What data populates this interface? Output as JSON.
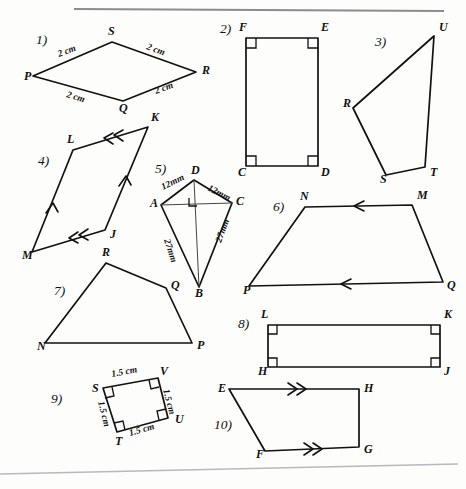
{
  "page": {
    "background_color": "#fdfdfc",
    "ink_color": "#111111",
    "scan_edge_color": "#8c8c90"
  },
  "figures": [
    {
      "number": "1)",
      "shape": "rhombus",
      "vertices": [
        {
          "label": "P",
          "x": 33,
          "y": 76,
          "lx": 24,
          "ly": 80
        },
        {
          "label": "S",
          "x": 112,
          "y": 42,
          "lx": 108,
          "ly": 35
        },
        {
          "label": "R",
          "x": 196,
          "y": 72,
          "lx": 202,
          "ly": 74
        },
        {
          "label": "Q",
          "x": 123,
          "y": 101,
          "lx": 119,
          "ly": 112
        }
      ],
      "number_pos": {
        "x": 36,
        "y": 44
      },
      "measures": [
        {
          "text": "2 cm",
          "x": 59,
          "y": 57,
          "rotate": -21
        },
        {
          "text": "2 cm",
          "x": 146,
          "y": 49,
          "rotate": 20
        },
        {
          "text": "2 cm",
          "x": 66,
          "y": 97,
          "rotate": 17
        },
        {
          "text": "2 cm",
          "x": 156,
          "y": 94,
          "rotate": -20
        }
      ]
    },
    {
      "number": "2)",
      "shape": "rectangle",
      "vertices": [
        {
          "label": "F",
          "x": 246,
          "y": 38,
          "lx": 239,
          "ly": 31
        },
        {
          "label": "E",
          "x": 318,
          "y": 38,
          "lx": 321,
          "ly": 31
        },
        {
          "label": "D",
          "x": 318,
          "y": 166,
          "lx": 321,
          "ly": 176
        },
        {
          "label": "C",
          "x": 246,
          "y": 166,
          "lx": 238,
          "ly": 176
        }
      ],
      "number_pos": {
        "x": 220,
        "y": 33
      },
      "right_angles": [
        "F",
        "E",
        "D",
        "C"
      ]
    },
    {
      "number": "3)",
      "shape": "irregular-quadrilateral",
      "vertices": [
        {
          "label": "U",
          "x": 434,
          "y": 36,
          "lx": 439,
          "ly": 31
        },
        {
          "label": "T",
          "x": 425,
          "y": 167,
          "lx": 430,
          "ly": 176
        },
        {
          "label": "S",
          "x": 386,
          "y": 175,
          "lx": 380,
          "ly": 183
        },
        {
          "label": "R",
          "x": 353,
          "y": 108,
          "lx": 343,
          "ly": 107
        }
      ],
      "number_pos": {
        "x": 375,
        "y": 46
      }
    },
    {
      "number": "4)",
      "shape": "parallelogram",
      "vertices": [
        {
          "label": "K",
          "x": 148,
          "y": 127,
          "lx": 151,
          "ly": 121
        },
        {
          "label": "L",
          "x": 73,
          "y": 150,
          "lx": 67,
          "ly": 143
        },
        {
          "label": "M",
          "x": 32,
          "y": 252,
          "lx": 22,
          "ly": 259
        },
        {
          "label": "J",
          "x": 105,
          "y": 230,
          "lx": 110,
          "ly": 238
        }
      ],
      "number_pos": {
        "x": 38,
        "y": 165
      },
      "tick_marks": "double on KL and JM, single on LM and JK"
    },
    {
      "number": "5)",
      "shape": "kite",
      "vertices": [
        {
          "label": "D",
          "x": 194,
          "y": 180,
          "lx": 191,
          "ly": 174
        },
        {
          "label": "C",
          "x": 232,
          "y": 203,
          "lx": 236,
          "ly": 205
        },
        {
          "label": "B",
          "x": 199,
          "y": 287,
          "lx": 195,
          "ly": 297
        },
        {
          "label": "A",
          "x": 161,
          "y": 205,
          "lx": 150,
          "ly": 207
        }
      ],
      "number_pos": {
        "x": 155,
        "y": 173
      },
      "diagonals": [
        "D-B",
        "A-C"
      ],
      "right_angle_at": "intersection of diagonals",
      "measures": [
        {
          "text": "12mm",
          "x": 163,
          "y": 190,
          "rotate": -26
        },
        {
          "text": "12mm",
          "x": 207,
          "y": 190,
          "rotate": 27
        },
        {
          "text": "27mm",
          "x": 164,
          "y": 240,
          "rotate": 72
        },
        {
          "text": "27mm",
          "x": 221,
          "y": 243,
          "rotate": -70
        }
      ]
    },
    {
      "number": "6)",
      "shape": "trapezoid",
      "vertices": [
        {
          "label": "N",
          "x": 305,
          "y": 207,
          "lx": 300,
          "ly": 200
        },
        {
          "label": "M",
          "x": 412,
          "y": 205,
          "lx": 417,
          "ly": 199
        },
        {
          "label": "Q",
          "x": 443,
          "y": 282,
          "lx": 447,
          "ly": 289
        },
        {
          "label": "P",
          "x": 249,
          "y": 286,
          "lx": 243,
          "ly": 294
        }
      ],
      "number_pos": {
        "x": 273,
        "y": 211
      },
      "tick_marks": "single arrow on NM and PQ"
    },
    {
      "number": "7)",
      "shape": "irregular-quadrilateral",
      "vertices": [
        {
          "label": "R",
          "x": 106,
          "y": 263,
          "lx": 102,
          "ly": 256
        },
        {
          "label": "Q",
          "x": 166,
          "y": 288,
          "lx": 171,
          "ly": 289
        },
        {
          "label": "P",
          "x": 192,
          "y": 343,
          "lx": 197,
          "ly": 349
        },
        {
          "label": "N",
          "x": 45,
          "y": 343,
          "lx": 37,
          "ly": 350
        }
      ],
      "number_pos": {
        "x": 54,
        "y": 295
      }
    },
    {
      "number": "8)",
      "shape": "rectangle",
      "vertices": [
        {
          "label": "L",
          "x": 268,
          "y": 325,
          "lx": 261,
          "ly": 318
        },
        {
          "label": "K",
          "x": 440,
          "y": 325,
          "lx": 444,
          "ly": 318
        },
        {
          "label": "J",
          "x": 440,
          "y": 367,
          "lx": 444,
          "ly": 375
        },
        {
          "label": "H",
          "x": 268,
          "y": 367,
          "lx": 258,
          "ly": 375
        }
      ],
      "number_pos": {
        "x": 238,
        "y": 328
      },
      "right_angles": [
        "L",
        "K",
        "J",
        "H"
      ]
    },
    {
      "number": "9)",
      "shape": "square",
      "vertices": [
        {
          "label": "S",
          "x": 103,
          "y": 388,
          "lx": 92,
          "ly": 392
        },
        {
          "label": "V",
          "x": 158,
          "y": 378,
          "lx": 160,
          "ly": 375
        },
        {
          "label": "U",
          "x": 168,
          "y": 418,
          "lx": 175,
          "ly": 423
        },
        {
          "label": "T",
          "x": 117,
          "y": 432,
          "lx": 115,
          "ly": 445
        }
      ],
      "number_pos": {
        "x": 51,
        "y": 403
      },
      "right_angles": [
        "S",
        "V",
        "U",
        "T"
      ],
      "measures": [
        {
          "text": "1.5 cm",
          "x": 112,
          "y": 377,
          "rotate": -11
        },
        {
          "text": "1.5 cm",
          "x": 163,
          "y": 390,
          "rotate": 75
        },
        {
          "text": "1.5 cm",
          "x": 98,
          "y": 402,
          "rotate": 76
        },
        {
          "text": "1.5 cm",
          "x": 130,
          "y": 436,
          "rotate": -16
        }
      ]
    },
    {
      "number": "10)",
      "shape": "trapezoid",
      "vertices": [
        {
          "label": "E",
          "x": 229,
          "y": 389,
          "lx": 218,
          "ly": 392
        },
        {
          "label": "H",
          "x": 359,
          "y": 389,
          "lx": 364,
          "ly": 392
        },
        {
          "label": "G",
          "x": 359,
          "y": 447,
          "lx": 364,
          "ly": 453
        },
        {
          "label": "F",
          "x": 265,
          "y": 451,
          "lx": 256,
          "ly": 458
        }
      ],
      "number_pos": {
        "x": 214,
        "y": 429
      },
      "tick_marks": "double arrow on EH and FG"
    }
  ],
  "scan_artifacts": {
    "top_line": "dark horizontal scan edge near top of page",
    "bottom_line": "faint slanted scan edge near bottom of page"
  }
}
